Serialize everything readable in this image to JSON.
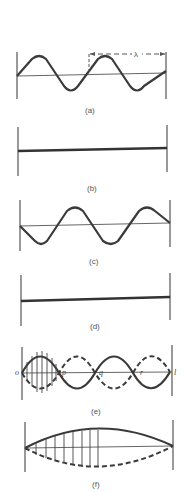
{
  "figure": {
    "panels": [
      {
        "id": "a",
        "label": "(a)",
        "description": "traveling sine wave with wavelength marker",
        "annotation": "λ"
      },
      {
        "id": "b",
        "label": "(b)",
        "description": "flat string"
      },
      {
        "id": "c",
        "label": "(c)",
        "description": "inverted sine wave"
      },
      {
        "id": "d",
        "label": "(d)",
        "description": "flat string"
      },
      {
        "id": "e",
        "label": "(e)",
        "description": "standing wave with nodes",
        "points": [
          "o",
          "p",
          "q",
          "r",
          "l"
        ]
      },
      {
        "id": "f",
        "label": "(f)",
        "description": "fundamental mode standing wave with displacement arrows"
      }
    ]
  },
  "colors": {
    "line": "#3a3a3a",
    "background": "#ffffff"
  }
}
